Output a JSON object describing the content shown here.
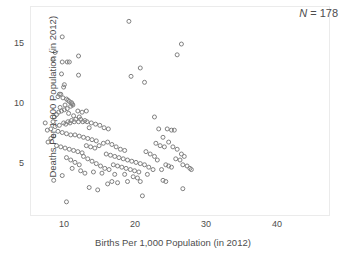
{
  "chart_data": {
    "type": "scatter",
    "title": "",
    "xlabel": "Births Per 1,000 Population (in 2012)",
    "ylabel": "Deaths Per 1,000 Population (in 2012)",
    "xlim": [
      5.2,
      47.2
    ],
    "ylim": [
      0.8,
      18.2
    ],
    "grid": false,
    "legend": null,
    "xticks": [
      10,
      20,
      30,
      40
    ],
    "xticklabels": [
      "10",
      "20",
      "30",
      "40"
    ],
    "yticks": [
      5,
      10,
      15
    ],
    "yticklabels": [
      "5",
      "10",
      "15"
    ],
    "marker": "open-circle",
    "marker_color": "#808080",
    "marker_size": 4,
    "annotations": [
      {
        "name": "sample-size",
        "symbol": "N",
        "separator": " = ",
        "value": "178",
        "position": "top-right"
      }
    ],
    "n_points": 178,
    "series": [
      {
        "name": "countries",
        "points": [
          [
            8.3,
            8.6
          ],
          [
            7.2,
            8.5
          ],
          [
            9.6,
            15.7
          ],
          [
            8.6,
            14.4
          ],
          [
            8.3,
            13.8
          ],
          [
            9.6,
            13.6
          ],
          [
            10.3,
            13.6
          ],
          [
            10.6,
            13.6
          ],
          [
            11.9,
            14.1
          ],
          [
            9.5,
            12.6
          ],
          [
            11.9,
            12.5
          ],
          [
            9.9,
            11.7
          ],
          [
            9.8,
            11.5
          ],
          [
            9.2,
            10.9
          ],
          [
            9.4,
            10.9
          ],
          [
            9.0,
            10.7
          ],
          [
            9.7,
            10.6
          ],
          [
            10.2,
            10.5
          ],
          [
            10.4,
            10.4
          ],
          [
            10.6,
            10.3
          ],
          [
            10.9,
            10.2
          ],
          [
            11.0,
            10.1
          ],
          [
            11.1,
            10.0
          ],
          [
            10.8,
            9.9
          ],
          [
            10.3,
            9.7
          ],
          [
            9.9,
            9.6
          ],
          [
            9.5,
            9.5
          ],
          [
            9.1,
            9.4
          ],
          [
            8.8,
            9.2
          ],
          [
            8.5,
            9.0
          ],
          [
            9.3,
            9.8
          ],
          [
            10.0,
            10.0
          ],
          [
            10.5,
            9.3
          ],
          [
            11.2,
            9.1
          ],
          [
            11.8,
            9.5
          ],
          [
            12.4,
            9.4
          ],
          [
            13.0,
            9.5
          ],
          [
            12.0,
            9.0
          ],
          [
            11.5,
            8.8
          ],
          [
            10.9,
            8.7
          ],
          [
            10.4,
            8.6
          ],
          [
            9.8,
            8.5
          ],
          [
            9.2,
            8.3
          ],
          [
            8.6,
            8.2
          ],
          [
            8.0,
            8.0
          ],
          [
            7.5,
            7.9
          ],
          [
            10.1,
            8.4
          ],
          [
            10.7,
            8.5
          ],
          [
            11.3,
            8.6
          ],
          [
            11.9,
            8.6
          ],
          [
            12.5,
            8.6
          ],
          [
            13.1,
            8.6
          ],
          [
            13.7,
            8.5
          ],
          [
            14.3,
            8.4
          ],
          [
            14.9,
            8.3
          ],
          [
            15.5,
            8.1
          ],
          [
            16.1,
            8.0
          ],
          [
            12.8,
            8.7
          ],
          [
            12.2,
            8.8
          ],
          [
            13.4,
            8.1
          ],
          [
            9.0,
            7.8
          ],
          [
            9.6,
            7.7
          ],
          [
            10.2,
            7.6
          ],
          [
            10.8,
            7.5
          ],
          [
            11.4,
            7.5
          ],
          [
            12.0,
            7.4
          ],
          [
            12.6,
            7.3
          ],
          [
            13.2,
            7.2
          ],
          [
            13.8,
            7.1
          ],
          [
            14.4,
            7.0
          ],
          [
            8.4,
            7.4
          ],
          [
            8.0,
            7.2
          ],
          [
            7.6,
            6.9
          ],
          [
            8.8,
            6.6
          ],
          [
            9.4,
            6.5
          ],
          [
            10.0,
            6.4
          ],
          [
            10.6,
            6.3
          ],
          [
            11.2,
            6.2
          ],
          [
            11.8,
            6.1
          ],
          [
            12.4,
            6.0
          ],
          [
            13.0,
            6.6
          ],
          [
            13.6,
            6.5
          ],
          [
            14.2,
            6.4
          ],
          [
            14.8,
            6.6
          ],
          [
            15.4,
            6.8
          ],
          [
            16.0,
            6.9
          ],
          [
            16.6,
            6.7
          ],
          [
            17.2,
            6.5
          ],
          [
            17.8,
            6.3
          ],
          [
            18.4,
            6.2
          ],
          [
            15.8,
            5.9
          ],
          [
            16.4,
            5.8
          ],
          [
            17.0,
            5.7
          ],
          [
            17.6,
            5.6
          ],
          [
            18.2,
            5.5
          ],
          [
            18.8,
            5.4
          ],
          [
            19.4,
            5.3
          ],
          [
            20.0,
            5.2
          ],
          [
            20.6,
            5.1
          ],
          [
            21.2,
            5.0
          ],
          [
            16.8,
            5.0
          ],
          [
            17.4,
            4.9
          ],
          [
            18.0,
            4.8
          ],
          [
            18.6,
            4.7
          ],
          [
            19.2,
            4.6
          ],
          [
            19.8,
            4.5
          ],
          [
            20.4,
            4.4
          ],
          [
            16.2,
            4.6
          ],
          [
            15.6,
            4.7
          ],
          [
            15.0,
            4.9
          ],
          [
            14.4,
            5.1
          ],
          [
            13.8,
            5.3
          ],
          [
            13.2,
            5.5
          ],
          [
            12.6,
            5.7
          ],
          [
            12.0,
            5.0
          ],
          [
            11.4,
            5.2
          ],
          [
            10.8,
            5.4
          ],
          [
            10.2,
            5.6
          ],
          [
            11.0,
            4.7
          ],
          [
            12.2,
            4.5
          ],
          [
            9.6,
            4.1
          ],
          [
            8.4,
            3.7
          ],
          [
            10.2,
            1.9
          ],
          [
            13.4,
            3.1
          ],
          [
            14.6,
            2.9
          ],
          [
            16.0,
            3.4
          ],
          [
            16.6,
            3.6
          ],
          [
            17.4,
            3.5
          ],
          [
            18.8,
            3.6
          ],
          [
            20.6,
            3.6
          ],
          [
            20.9,
            2.4
          ],
          [
            19.3,
            12.4
          ],
          [
            19.0,
            17.0
          ],
          [
            20.6,
            13.1
          ],
          [
            21.2,
            11.9
          ],
          [
            22.6,
            9.0
          ],
          [
            23.2,
            8.0
          ],
          [
            24.4,
            8.0
          ],
          [
            25.0,
            7.9
          ],
          [
            25.4,
            7.9
          ],
          [
            23.8,
            7.3
          ],
          [
            24.6,
            6.9
          ],
          [
            22.8,
            6.8
          ],
          [
            23.4,
            6.6
          ],
          [
            24.0,
            6.5
          ],
          [
            25.2,
            6.5
          ],
          [
            25.8,
            6.3
          ],
          [
            26.4,
            5.9
          ],
          [
            26.8,
            5.7
          ],
          [
            25.6,
            5.5
          ],
          [
            26.2,
            5.4
          ],
          [
            26.6,
            5.0
          ],
          [
            27.2,
            4.9
          ],
          [
            27.6,
            4.7
          ],
          [
            27.8,
            4.6
          ],
          [
            24.2,
            5.0
          ],
          [
            24.6,
            4.9
          ],
          [
            25.0,
            4.8
          ],
          [
            23.6,
            4.6
          ],
          [
            22.4,
            4.6
          ],
          [
            21.8,
            4.8
          ],
          [
            22.0,
            5.9
          ],
          [
            22.6,
            5.7
          ],
          [
            23.0,
            5.4
          ],
          [
            21.4,
            6.1
          ],
          [
            26.4,
            15.1
          ],
          [
            25.8,
            14.2
          ],
          [
            26.6,
            3.0
          ],
          [
            23.8,
            3.7
          ],
          [
            24.2,
            3.6
          ],
          [
            21.6,
            4.2
          ],
          [
            20.2,
            3.9
          ],
          [
            19.6,
            4.0
          ],
          [
            18.4,
            4.2
          ],
          [
            17.0,
            4.2
          ],
          [
            15.2,
            4.3
          ],
          [
            14.0,
            4.4
          ],
          [
            12.8,
            4.3
          ]
        ]
      }
    ]
  },
  "axis": {
    "x_title": "Births Per 1,000 Population (in 2012)",
    "y_title": "Deaths Per 1,000 Population (in 2012)"
  },
  "annotation": {
    "n_symbol": "N",
    "n_equals": " = ",
    "n_value": "178"
  }
}
